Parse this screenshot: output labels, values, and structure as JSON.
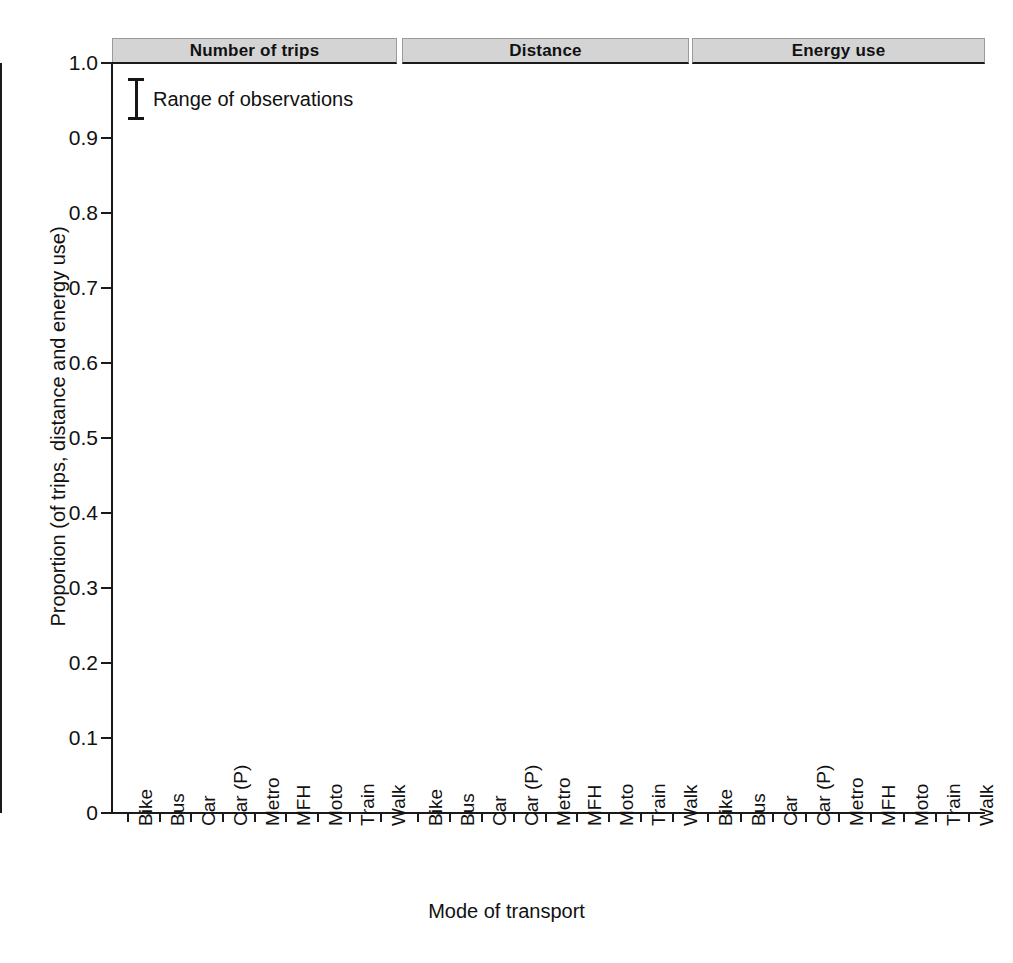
{
  "chart_data": {
    "type": "bar",
    "title": "",
    "xlabel": "Mode of transport",
    "ylabel": "Proportion (of trips, distance and energy use)",
    "ylim": [
      0,
      1.0
    ],
    "yticks": [
      "0",
      "0.1",
      "0.2",
      "0.3",
      "0.4",
      "0.5",
      "0.6",
      "0.7",
      "0.8",
      "0.9",
      "1.0"
    ],
    "ytick_values": [
      0,
      0.1,
      0.2,
      0.3,
      0.4,
      0.5,
      0.6,
      0.7,
      0.8,
      0.9,
      1.0
    ],
    "grid": "alternating horizontal shaded bands",
    "legend": {
      "position": "top-left inside first panel",
      "entries": [
        "Range of observations"
      ]
    },
    "categories": [
      "Bike",
      "Bus",
      "Car",
      "Car (P)",
      "Metro",
      "MFH",
      "Moto",
      "Train",
      "Walk"
    ],
    "panels": [
      {
        "label": "Number of trips",
        "values": [
          0.031,
          0.106,
          0.537,
          0.071,
          0.003,
          0.108,
          0.004,
          0.015,
          0.108
        ],
        "err_low": [
          0.0,
          0.005,
          0.245,
          0.026,
          0.0,
          0.0,
          0.0,
          0.0,
          0.026
        ],
        "err_high": [
          0.166,
          0.325,
          0.717,
          0.13,
          0.149,
          0.427,
          0.008,
          0.11,
          0.403
        ],
        "bar_colors": [
          "#575757",
          "#cccccc",
          "#d9d9d9",
          "#4d4d4d",
          "#6e6e6e",
          "#8f8f8f",
          "#e2e2e2",
          "#dcdcdc",
          "#8a8a8a"
        ]
      },
      {
        "label": "Distance",
        "values": [
          0.01,
          0.069,
          0.73,
          0.089,
          0.005,
          0.003,
          0.009,
          0.032,
          0.024
        ],
        "err_low": [
          0.0,
          0.0,
          0.513,
          0.024,
          0.0,
          0.0,
          0.0,
          0.0,
          0.0
        ],
        "err_high": [
          0.078,
          0.255,
          0.88,
          0.196,
          0.02,
          0.006,
          0.031,
          0.2,
          0.111
        ],
        "bar_colors": [
          "#575757",
          "#cccccc",
          "#cfcfcf",
          "#4d4d4d",
          "#6e6e6e",
          "#3d3d3d",
          "#9a9a9a",
          "#dcdcdc",
          "#8a8a8a"
        ]
      },
      {
        "label": "Energy use",
        "values": [
          0.003,
          0.024,
          0.952,
          0.0,
          0.001,
          0.0,
          0.003,
          0.003,
          0.003
        ],
        "err_low": [
          0.0,
          0.0,
          0.856,
          0.0,
          0.0,
          0.0,
          0.0,
          0.0,
          0.0
        ],
        "err_high": [
          0.006,
          0.109,
          0.978,
          0.0,
          0.04,
          0.0,
          0.013,
          0.031,
          0.007
        ],
        "bar_colors": [
          "#575757",
          "#c9c9c9",
          "#bdbdbd",
          "#d9d9d9",
          "#6e6e6e",
          "#8f8f8f",
          "#b5b5b5",
          "#c2c2c2",
          "#8a8a8a"
        ]
      }
    ]
  },
  "colors": {
    "strip_bg": "#d4d4d4",
    "band": "#f0f0f0",
    "axis": "#1a1a1a",
    "whisker": "#151515",
    "text": "#111111"
  }
}
